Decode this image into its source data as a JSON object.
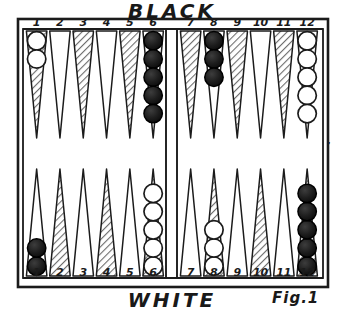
{
  "figure": {
    "caption": "Fig.1",
    "top_player_label": "BLACK",
    "bottom_player_label": "WHITE",
    "bar_label": "BAR",
    "inner_table_label": "INNER TABLE",
    "outer_table_label": "OUTER TABLE"
  },
  "board": {
    "point_numbers_top": [
      "1",
      "2",
      "3",
      "4",
      "5",
      "6",
      "7",
      "8",
      "9",
      "10",
      "11",
      "12"
    ],
    "point_numbers_bottom": [
      "1",
      "2",
      "3",
      "4",
      "5",
      "6",
      "7",
      "8",
      "9",
      "10",
      "11",
      "12"
    ],
    "colors": {
      "ink": "#1b1b1b",
      "paper": "#ffffff",
      "hatch": "#8a8a8a",
      "black_checker": "#161616",
      "white_checker": "#ffffff"
    },
    "points": [
      {
        "number": "1",
        "row": "top",
        "shaded": true,
        "checkers": 2,
        "checker_color": "white"
      },
      {
        "number": "2",
        "row": "top",
        "shaded": false,
        "checkers": 0,
        "checker_color": null
      },
      {
        "number": "3",
        "row": "top",
        "shaded": true,
        "checkers": 0,
        "checker_color": null
      },
      {
        "number": "4",
        "row": "top",
        "shaded": false,
        "checkers": 0,
        "checker_color": null
      },
      {
        "number": "5",
        "row": "top",
        "shaded": true,
        "checkers": 0,
        "checker_color": null
      },
      {
        "number": "6",
        "row": "top",
        "shaded": false,
        "checkers": 5,
        "checker_color": "black"
      },
      {
        "number": "7",
        "row": "top",
        "shaded": true,
        "checkers": 0,
        "checker_color": null
      },
      {
        "number": "8",
        "row": "top",
        "shaded": false,
        "checkers": 3,
        "checker_color": "black"
      },
      {
        "number": "9",
        "row": "top",
        "shaded": true,
        "checkers": 0,
        "checker_color": null
      },
      {
        "number": "10",
        "row": "top",
        "shaded": false,
        "checkers": 0,
        "checker_color": null
      },
      {
        "number": "11",
        "row": "top",
        "shaded": true,
        "checkers": 0,
        "checker_color": null
      },
      {
        "number": "12",
        "row": "top",
        "shaded": false,
        "checkers": 5,
        "checker_color": "white"
      },
      {
        "number": "1",
        "row": "bottom",
        "shaded": false,
        "checkers": 2,
        "checker_color": "black"
      },
      {
        "number": "2",
        "row": "bottom",
        "shaded": true,
        "checkers": 0,
        "checker_color": null
      },
      {
        "number": "3",
        "row": "bottom",
        "shaded": false,
        "checkers": 0,
        "checker_color": null
      },
      {
        "number": "4",
        "row": "bottom",
        "shaded": true,
        "checkers": 0,
        "checker_color": null
      },
      {
        "number": "5",
        "row": "bottom",
        "shaded": false,
        "checkers": 0,
        "checker_color": null
      },
      {
        "number": "6",
        "row": "bottom",
        "shaded": true,
        "checkers": 5,
        "checker_color": "white"
      },
      {
        "number": "7",
        "row": "bottom",
        "shaded": false,
        "checkers": 0,
        "checker_color": null
      },
      {
        "number": "8",
        "row": "bottom",
        "shaded": true,
        "checkers": 3,
        "checker_color": "white"
      },
      {
        "number": "9",
        "row": "bottom",
        "shaded": false,
        "checkers": 0,
        "checker_color": null
      },
      {
        "number": "10",
        "row": "bottom",
        "shaded": true,
        "checkers": 0,
        "checker_color": null
      },
      {
        "number": "11",
        "row": "bottom",
        "shaded": false,
        "checkers": 0,
        "checker_color": null
      },
      {
        "number": "12",
        "row": "bottom",
        "shaded": true,
        "checkers": 5,
        "checker_color": "black"
      }
    ]
  }
}
